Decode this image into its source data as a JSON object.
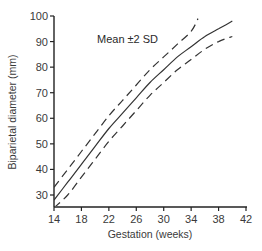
{
  "chart_data": {
    "type": "line",
    "title": "",
    "xlabel": "Gestation (weeks)",
    "ylabel": "Biparietal diameter (mm)",
    "xlim": [
      14,
      42
    ],
    "ylim": [
      25,
      100
    ],
    "x_ticks": [
      14,
      18,
      22,
      26,
      30,
      34,
      38,
      42
    ],
    "y_ticks": [
      30,
      40,
      50,
      60,
      70,
      80,
      90,
      100
    ],
    "grid": false,
    "annotation": "Mean ±2 SD",
    "series": [
      {
        "name": "Mean",
        "style": "solid",
        "x": [
          14,
          16,
          18,
          20,
          22,
          24,
          26,
          28,
          30,
          32,
          34,
          36,
          38,
          40
        ],
        "y": [
          28,
          35,
          42,
          49,
          56,
          62,
          68,
          74,
          79,
          84,
          88,
          92,
          95,
          98
        ]
      },
      {
        "name": "+2 SD",
        "style": "dashed",
        "x": [
          14,
          16,
          18,
          20,
          22,
          24,
          26,
          28,
          30,
          32,
          34,
          35
        ],
        "y": [
          33,
          40,
          47,
          54,
          61,
          67,
          73,
          79,
          84,
          89,
          94,
          99
        ]
      },
      {
        "name": "-2 SD",
        "style": "dashed",
        "x": [
          14,
          16,
          18,
          20,
          22,
          24,
          26,
          28,
          30,
          32,
          34,
          36,
          38,
          40
        ],
        "y": [
          25,
          30,
          37,
          44,
          51,
          57,
          63,
          69,
          74,
          79,
          83,
          87,
          90,
          92
        ]
      }
    ]
  },
  "labels": {
    "xlabel": "Gestation (weeks)",
    "ylabel": "Biparietal diameter (mm)",
    "annotation": "Mean ±2 SD",
    "x_ticks": [
      "14",
      "18",
      "22",
      "26",
      "30",
      "34",
      "38",
      "42"
    ],
    "y_ticks": [
      "30",
      "40",
      "50",
      "60",
      "70",
      "80",
      "90",
      "100"
    ]
  }
}
